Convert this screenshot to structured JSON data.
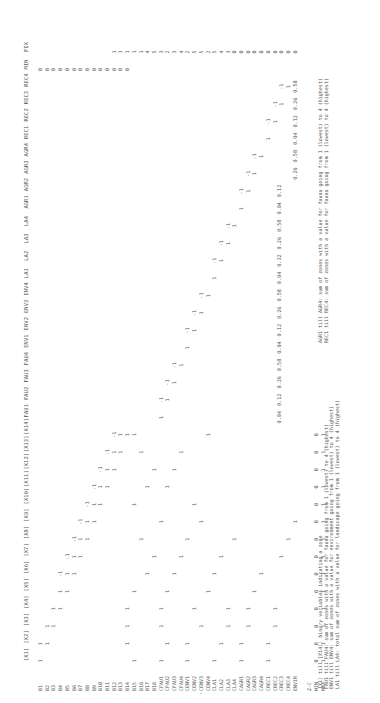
{
  "table": {
    "columns": [
      "[X1]",
      "[X2]",
      "[X3]",
      "[X4]",
      "[X5]",
      "[X6]",
      "[X7]",
      "[X8]",
      "[X9]",
      "[X10]",
      "[X11]",
      "[X12]",
      "[X13]",
      "[X14]",
      "FAU1",
      "FAU2",
      "FAU3",
      "FAU4",
      "ENV1",
      "ENV2",
      "ENV3",
      "ENV4",
      "LA1",
      "LA2",
      "LA3",
      "LA4",
      "AGR1",
      "AGR2",
      "AGR3",
      "AGR4",
      "REC1",
      "REC2",
      "REC3",
      "REC4",
      "MIN",
      "FIX"
    ],
    "rows": [
      "B1",
      "B2",
      "B3",
      "B4",
      "B5",
      "B6",
      "B7",
      "B8",
      "B9",
      "B10",
      "B11",
      "B12",
      "B13",
      "B14",
      "B15",
      "B16",
      "B17",
      "B18",
      "CFAU1",
      "CFAU2",
      "CFAU3",
      "CFAU4",
      "CENV1",
      "CENV2",
      "CENV3",
      "CENV4",
      "CLA1",
      "CLA2",
      "CLA3",
      "CLA4",
      "CAGR1",
      "CAGR2",
      "CAGR3",
      "CAGR4",
      "CREC1",
      "CREC2",
      "CREC3",
      "CREC4",
      "ENVIR"
    ],
    "footer_rows": [
      "Z-C",
      "MIN",
      "MAX"
    ],
    "cells": [
      {
        "r": 0,
        "c": 0,
        "v": "1"
      },
      {
        "r": 0,
        "c": 1,
        "v": "1"
      },
      {
        "r": 1,
        "c": 1,
        "v": "1"
      },
      {
        "r": 1,
        "c": 2,
        "v": "1"
      },
      {
        "r": 2,
        "c": 2,
        "v": "1"
      },
      {
        "r": 2,
        "c": 3,
        "v": "1"
      },
      {
        "r": 3,
        "c": 3,
        "v": "1"
      },
      {
        "r": 3,
        "c": 4,
        "v": "1"
      },
      {
        "r": 3,
        "c": 5,
        "v": "-1"
      },
      {
        "r": 4,
        "c": 4,
        "v": "1"
      },
      {
        "r": 4,
        "c": 5,
        "v": "1"
      },
      {
        "r": 4,
        "c": 6,
        "v": "-1"
      },
      {
        "r": 5,
        "c": 5,
        "v": "1"
      },
      {
        "r": 5,
        "c": 6,
        "v": "1"
      },
      {
        "r": 5,
        "c": 7,
        "v": "-1"
      },
      {
        "r": 6,
        "c": 6,
        "v": "1"
      },
      {
        "r": 6,
        "c": 7,
        "v": "1"
      },
      {
        "r": 6,
        "c": 8,
        "v": "-1"
      },
      {
        "r": 7,
        "c": 7,
        "v": "1"
      },
      {
        "r": 7,
        "c": 8,
        "v": "1"
      },
      {
        "r": 7,
        "c": 9,
        "v": "-1"
      },
      {
        "r": 8,
        "c": 8,
        "v": "1"
      },
      {
        "r": 8,
        "c": 9,
        "v": "1"
      },
      {
        "r": 8,
        "c": 10,
        "v": "-1"
      },
      {
        "r": 9,
        "c": 9,
        "v": "1"
      },
      {
        "r": 9,
        "c": 10,
        "v": "1"
      },
      {
        "r": 9,
        "c": 11,
        "v": "-1"
      },
      {
        "r": 10,
        "c": 10,
        "v": "1"
      },
      {
        "r": 10,
        "c": 11,
        "v": "1"
      },
      {
        "r": 10,
        "c": 12,
        "v": "-1"
      },
      {
        "r": 11,
        "c": 11,
        "v": "1"
      },
      {
        "r": 11,
        "c": 12,
        "v": "1"
      },
      {
        "r": 11,
        "c": 13,
        "v": "-1"
      },
      {
        "r": 12,
        "c": 12,
        "v": "1"
      },
      {
        "r": 12,
        "c": 13,
        "v": "1"
      },
      {
        "r": 13,
        "c": 1,
        "v": "1"
      },
      {
        "r": 13,
        "c": 2,
        "v": "1"
      },
      {
        "r": 13,
        "c": 3,
        "v": "1"
      },
      {
        "r": 13,
        "c": 13,
        "v": "1"
      },
      {
        "r": 14,
        "c": 0,
        "v": "1"
      },
      {
        "r": 14,
        "c": 4,
        "v": "1"
      },
      {
        "r": 14,
        "c": 9,
        "v": "1"
      },
      {
        "r": 14,
        "c": 13,
        "v": "1"
      },
      {
        "r": 15,
        "c": 7,
        "v": "1"
      },
      {
        "r": 15,
        "c": 12,
        "v": "1"
      },
      {
        "r": 16,
        "c": 5,
        "v": "1"
      },
      {
        "r": 16,
        "c": 10,
        "v": "1"
      },
      {
        "r": 17,
        "c": 6,
        "v": "1"
      },
      {
        "r": 17,
        "c": 11,
        "v": "1"
      },
      {
        "r": 18,
        "c": 0,
        "v": "1"
      },
      {
        "r": 18,
        "c": 2,
        "v": "1"
      },
      {
        "r": 18,
        "c": 3,
        "v": "1"
      },
      {
        "r": 18,
        "c": 8,
        "v": "1"
      },
      {
        "r": 18,
        "c": 14,
        "v": "1"
      },
      {
        "r": 19,
        "c": 1,
        "v": "1"
      },
      {
        "r": 19,
        "c": 4,
        "v": "1"
      },
      {
        "r": 19,
        "c": 10,
        "v": "1"
      },
      {
        "r": 19,
        "c": 15,
        "v": "1"
      },
      {
        "r": 20,
        "c": 5,
        "v": "1"
      },
      {
        "r": 20,
        "c": 11,
        "v": "1"
      },
      {
        "r": 20,
        "c": 16,
        "v": "1"
      },
      {
        "r": 21,
        "c": 6,
        "v": "1"
      },
      {
        "r": 21,
        "c": 12,
        "v": "1"
      },
      {
        "r": 21,
        "c": 17,
        "v": "1"
      },
      {
        "r": 22,
        "c": 0,
        "v": "1"
      },
      {
        "r": 22,
        "c": 1,
        "v": "1"
      },
      {
        "r": 22,
        "c": 7,
        "v": "1"
      },
      {
        "r": 22,
        "c": 18,
        "v": "1"
      },
      {
        "r": 23,
        "c": 3,
        "v": "1"
      },
      {
        "r": 23,
        "c": 9,
        "v": "1"
      },
      {
        "r": 23,
        "c": 19,
        "v": "1"
      },
      {
        "r": 24,
        "c": 2,
        "v": "1"
      },
      {
        "r": 24,
        "c": 8,
        "v": "1"
      },
      {
        "r": 24,
        "c": 20,
        "v": "1"
      },
      {
        "r": 25,
        "c": 4,
        "v": "1"
      },
      {
        "r": 25,
        "c": 13,
        "v": "1"
      },
      {
        "r": 25,
        "c": 21,
        "v": "1"
      },
      {
        "r": 26,
        "c": 0,
        "v": "1"
      },
      {
        "r": 26,
        "c": 5,
        "v": "1"
      },
      {
        "r": 26,
        "c": 22,
        "v": "1"
      },
      {
        "r": 27,
        "c": 1,
        "v": "1"
      },
      {
        "r": 27,
        "c": 6,
        "v": "1"
      },
      {
        "r": 27,
        "c": 23,
        "v": "1"
      },
      {
        "r": 28,
        "c": 2,
        "v": "1"
      },
      {
        "r": 28,
        "c": 3,
        "v": "1"
      },
      {
        "r": 28,
        "c": 24,
        "v": "1"
      },
      {
        "r": 29,
        "c": 7,
        "v": "1"
      },
      {
        "r": 29,
        "c": 25,
        "v": "1"
      },
      {
        "r": 30,
        "c": 0,
        "v": "1"
      },
      {
        "r": 30,
        "c": 1,
        "v": "1"
      },
      {
        "r": 30,
        "c": 26,
        "v": "1"
      },
      {
        "r": 31,
        "c": 2,
        "v": "1"
      },
      {
        "r": 31,
        "c": 3,
        "v": "1"
      },
      {
        "r": 31,
        "c": 27,
        "v": "1"
      },
      {
        "r": 32,
        "c": 4,
        "v": "1"
      },
      {
        "r": 32,
        "c": 28,
        "v": "1"
      },
      {
        "r": 33,
        "c": 5,
        "v": "1"
      },
      {
        "r": 33,
        "c": 29,
        "v": "1"
      },
      {
        "r": 34,
        "c": 0,
        "v": "1"
      },
      {
        "r": 34,
        "c": 1,
        "v": "1"
      },
      {
        "r": 34,
        "c": 30,
        "v": "1"
      },
      {
        "r": 35,
        "c": 2,
        "v": "1"
      },
      {
        "r": 35,
        "c": 3,
        "v": "1"
      },
      {
        "r": 35,
        "c": 31,
        "v": "1"
      },
      {
        "r": 36,
        "c": 6,
        "v": "1"
      },
      {
        "r": 36,
        "c": 32,
        "v": "1"
      },
      {
        "r": 37,
        "c": 7,
        "v": "1"
      },
      {
        "r": 37,
        "c": 33,
        "v": "1"
      },
      {
        "r": 38,
        "c": 8,
        "v": "1"
      }
    ],
    "diag_minus": [
      {
        "r": 18,
        "c": 15,
        "v": "-1"
      },
      {
        "r": 19,
        "c": 16,
        "v": "-1"
      },
      {
        "r": 20,
        "c": 17,
        "v": "-1"
      },
      {
        "r": 22,
        "c": 19,
        "v": "-1"
      },
      {
        "r": 23,
        "c": 20,
        "v": "-1"
      },
      {
        "r": 24,
        "c": 21,
        "v": "-1"
      },
      {
        "r": 26,
        "c": 23,
        "v": "-1"
      },
      {
        "r": 27,
        "c": 24,
        "v": "-1"
      },
      {
        "r": 28,
        "c": 25,
        "v": "-1"
      },
      {
        "r": 30,
        "c": 27,
        "v": "-1"
      },
      {
        "r": 31,
        "c": 28,
        "v": "-1"
      },
      {
        "r": 32,
        "c": 29,
        "v": "-1"
      },
      {
        "r": 34,
        "c": 31,
        "v": "-1"
      },
      {
        "r": 35,
        "c": 32,
        "v": "-1"
      },
      {
        "r": 36,
        "c": 33,
        "v": "-1"
      }
    ],
    "min_col": [
      "0",
      "0",
      "0",
      "0",
      "0",
      "0",
      "0",
      "0",
      "0",
      "0",
      "0",
      "0",
      "0",
      "0"
    ],
    "fix_col": [
      "1",
      "1",
      "1",
      "1",
      "1",
      "4",
      "5",
      "3",
      "2",
      "3",
      "4",
      "2",
      "5",
      "5",
      "2",
      "5",
      "4",
      "3",
      "0",
      "0",
      "0",
      "0",
      "0",
      "0",
      "0",
      "0",
      "0",
      "0"
    ],
    "zc_values": [
      "0.04",
      "0.12",
      "0.26",
      "0.58",
      "0.04",
      "0.12",
      "0.26",
      "0.58",
      "0.04",
      "0.12",
      "0.26",
      "0.58",
      "0.04",
      "0.12",
      "0.26",
      "0.58",
      "0.04",
      "0.12",
      "0.26",
      "0.58"
    ],
    "min_row": [
      "0",
      "0",
      "0",
      "0",
      "0",
      "0",
      "0",
      "0",
      "0",
      "0",
      "0",
      "0",
      "0",
      "0"
    ],
    "max_row": [
      "1",
      "1",
      "1",
      "1",
      "1",
      "1",
      "1",
      "1",
      "1",
      "1",
      "1",
      "1",
      "1",
      "1"
    ]
  },
  "notes_left": [
    "[X1] till [X14]: binary variables indicating a zone",
    "FAU1 till FAU4: sum of zones with a value for fauna going from 1 (lowest) to 4 (highest)",
    "ENV1 till ENV4: sum of zones with a value for environment going from 1 (lowest) to 4 (highest)",
    "LA1 till LA4: total sum of zones with a value for landscape going from 1 (lowest) to 4 (highest)"
  ],
  "notes_right": [
    "AGR1 till AGR4: sum of zones with a value for fauna going from 1 (lowest) to 4 (highest)",
    "REC1 till REC4: sum of zones with a value for fauna going from 1 (lowest) to 4 (highest)"
  ]
}
